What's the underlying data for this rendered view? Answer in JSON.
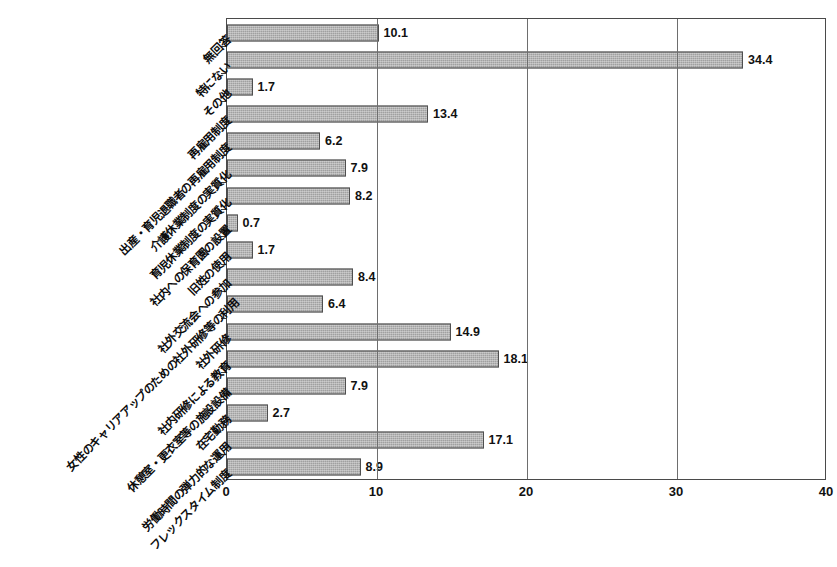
{
  "chart_data": {
    "type": "bar",
    "orientation": "horizontal",
    "title": "",
    "xlabel": "",
    "ylabel": "",
    "xlim": [
      0,
      40
    ],
    "xticks": [
      "0",
      "10",
      "20",
      "30",
      "40"
    ],
    "grid": true,
    "legend": false,
    "bar_color": "#a0a0a0",
    "bar_edge_color": "#4f4f4f",
    "categories": [
      "無回答",
      "特にない",
      "その他",
      "再雇用制度",
      "出産・育児退職者の再雇用制度",
      "介護休業制度の実質化",
      "育児休業制度の実質化",
      "社内への保育園の設置",
      "旧姓の使用",
      "社外交流会への参加",
      "女性のキャリアアップのための社外研修等の利用",
      "社外研修",
      "社内研修による教育",
      "休憩室・更衣室等の施設設備",
      "在宅勤務",
      "労働時間の弾力的な運用",
      "フレックスタイム制度"
    ],
    "values": [
      10.1,
      34.4,
      1.7,
      13.4,
      6.2,
      7.9,
      8.2,
      0.7,
      1.7,
      8.4,
      6.4,
      14.9,
      18.1,
      7.9,
      2.7,
      17.1,
      8.9
    ],
    "value_labels": [
      "10.1",
      "34.4",
      "1.7",
      "13.4",
      "6.2",
      "7.9",
      "8.2",
      "0.7",
      "1.7",
      "8.4",
      "6.4",
      "14.9",
      "18.1",
      "7.9",
      "2.7",
      "17.1",
      "8.9"
    ]
  },
  "chart": {
    "title_fragment": "                    "
  }
}
